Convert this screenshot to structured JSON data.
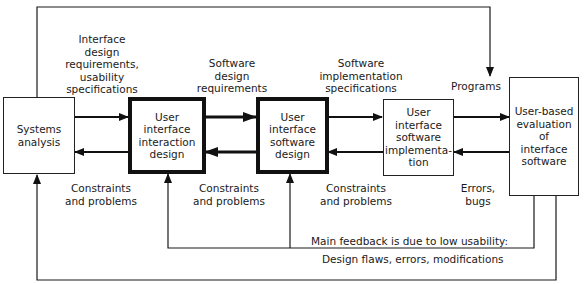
{
  "boxes": {
    "systems_analysis": "Systems\nanalysis",
    "interaction_design": "User\ninterface\ninteraction\ndesign",
    "software_design": "User\ninterface\nsoftware\ndesign",
    "software_implementation": "User\ninterface\nsoftware\nimplementa-\ntion",
    "evaluation": "User-based\nevaluation\nof\ninterface\nsoftware"
  },
  "labels": {
    "interface_requirements": "Interface\ndesign\nrequirements,\nusability\nspecifications",
    "software_design_requirements": "Software\ndesign\nrequirements",
    "software_implementation_specs": "Software\nimplementation\nspecifications",
    "programs": "Programs",
    "constraints_1": "Constraints\nand problems",
    "constraints_2": "Constraints\nand problems",
    "constraints_3": "Constraints\nand problems",
    "errors_bugs": "Errors,\nbugs",
    "main_feedback": "Main feedback is due to low usability:",
    "design_flaws": "Design flaws, errors, modifications"
  },
  "colors": {
    "line": "#1a1a1a",
    "background": "#ffffff"
  }
}
